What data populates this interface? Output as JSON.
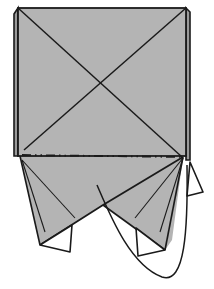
{
  "diagram": {
    "type": "origami-fold-step",
    "colors": {
      "paper": "#b4b4b4",
      "paper_back": "#ffffff",
      "line": "#1a1a1a",
      "background": "#ffffff"
    },
    "elements": [
      {
        "name": "square-body",
        "description": "Gray square with diagonal crease lines forming an X"
      },
      {
        "name": "mountain-fold-line",
        "description": "Horizontal dash-dot fold line across bottom of square"
      },
      {
        "name": "left-flap",
        "description": "Lower-left triangular flap with white tip"
      },
      {
        "name": "right-flap",
        "description": "Lower-right triangular flap with white tip"
      },
      {
        "name": "fold-arrow",
        "description": "Curved arrow loop indicating fold motion"
      }
    ]
  }
}
